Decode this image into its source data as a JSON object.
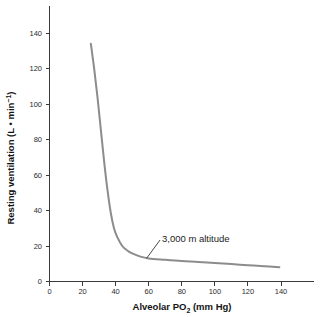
{
  "chart_data": {
    "type": "line",
    "title": "",
    "xlabel": "Alveolar PO2 (mm Hg)",
    "xlabel_main": "Alveolar PO",
    "xlabel_sub": "2",
    "xlabel_tail": " (mm Hg)",
    "ylabel": "Resting ventilation (L • min⁻¹)",
    "ylabel_main": "Resting ventilation (L • min",
    "ylabel_sup": "−1",
    "ylabel_tail": ")",
    "xlim": [
      0,
      160
    ],
    "ylim": [
      0,
      152
    ],
    "xticks": [
      0,
      20,
      40,
      60,
      80,
      100,
      120,
      140
    ],
    "xtick_labels": [
      "0",
      "20",
      "40",
      "60",
      "80",
      "100",
      "120",
      "140"
    ],
    "yticks": [
      0,
      20,
      40,
      60,
      80,
      100,
      120,
      140
    ],
    "ytick_labels": [
      "0",
      "20",
      "40",
      "60",
      "80",
      "100",
      "120",
      "140"
    ],
    "grid": false,
    "legend": "none",
    "line_color": "#8c8c8c",
    "axis_color": "#3a3a3a",
    "series": [
      {
        "name": "Resting ventilation vs alveolar PO2",
        "x": [
          25,
          27,
          29,
          31,
          33,
          35,
          37,
          39,
          41,
          44,
          47,
          50,
          55,
          60,
          70,
          80,
          90,
          100,
          110,
          120,
          130,
          139
        ],
        "y": [
          134,
          120,
          104,
          86,
          68,
          52,
          39,
          30,
          25,
          20,
          17.5,
          15.8,
          14,
          13,
          12.2,
          11.5,
          11,
          10.4,
          9.8,
          9.2,
          8.6,
          8
        ]
      }
    ],
    "annotations": [
      {
        "text": "3,000 m altitude",
        "x_data": 60,
        "y_data": 13,
        "label_x_data": 68,
        "label_y_data": 24
      }
    ]
  }
}
